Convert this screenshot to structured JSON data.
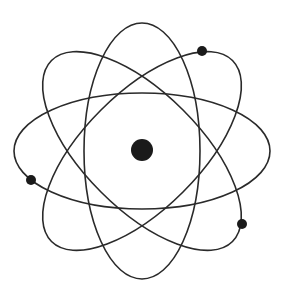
{
  "diagram": {
    "title": "Atom model",
    "colors": {
      "background": "#ffffff",
      "stroke": "#2a2a2a",
      "fill": "#1a1a1a"
    },
    "nucleus": {
      "cx": 142,
      "cy": 150,
      "r": 11
    },
    "orbits": [
      {
        "name": "orbit-vertical",
        "cx": 142,
        "cy": 151,
        "rx": 58,
        "ry": 128,
        "rotate": 0
      },
      {
        "name": "orbit-horizontal",
        "cx": 142,
        "cy": 151,
        "rx": 128,
        "ry": 58,
        "rotate": 0
      },
      {
        "name": "orbit-tilt-left",
        "cx": 142,
        "cy": 151,
        "rx": 128,
        "ry": 58,
        "rotate": 45
      },
      {
        "name": "orbit-tilt-right",
        "cx": 142,
        "cy": 151,
        "rx": 128,
        "ry": 58,
        "rotate": -45
      }
    ],
    "electrons": [
      {
        "cx": 202,
        "cy": 51,
        "r": 5
      },
      {
        "cx": 31,
        "cy": 180,
        "r": 5
      },
      {
        "cx": 242,
        "cy": 224,
        "r": 5
      }
    ]
  }
}
